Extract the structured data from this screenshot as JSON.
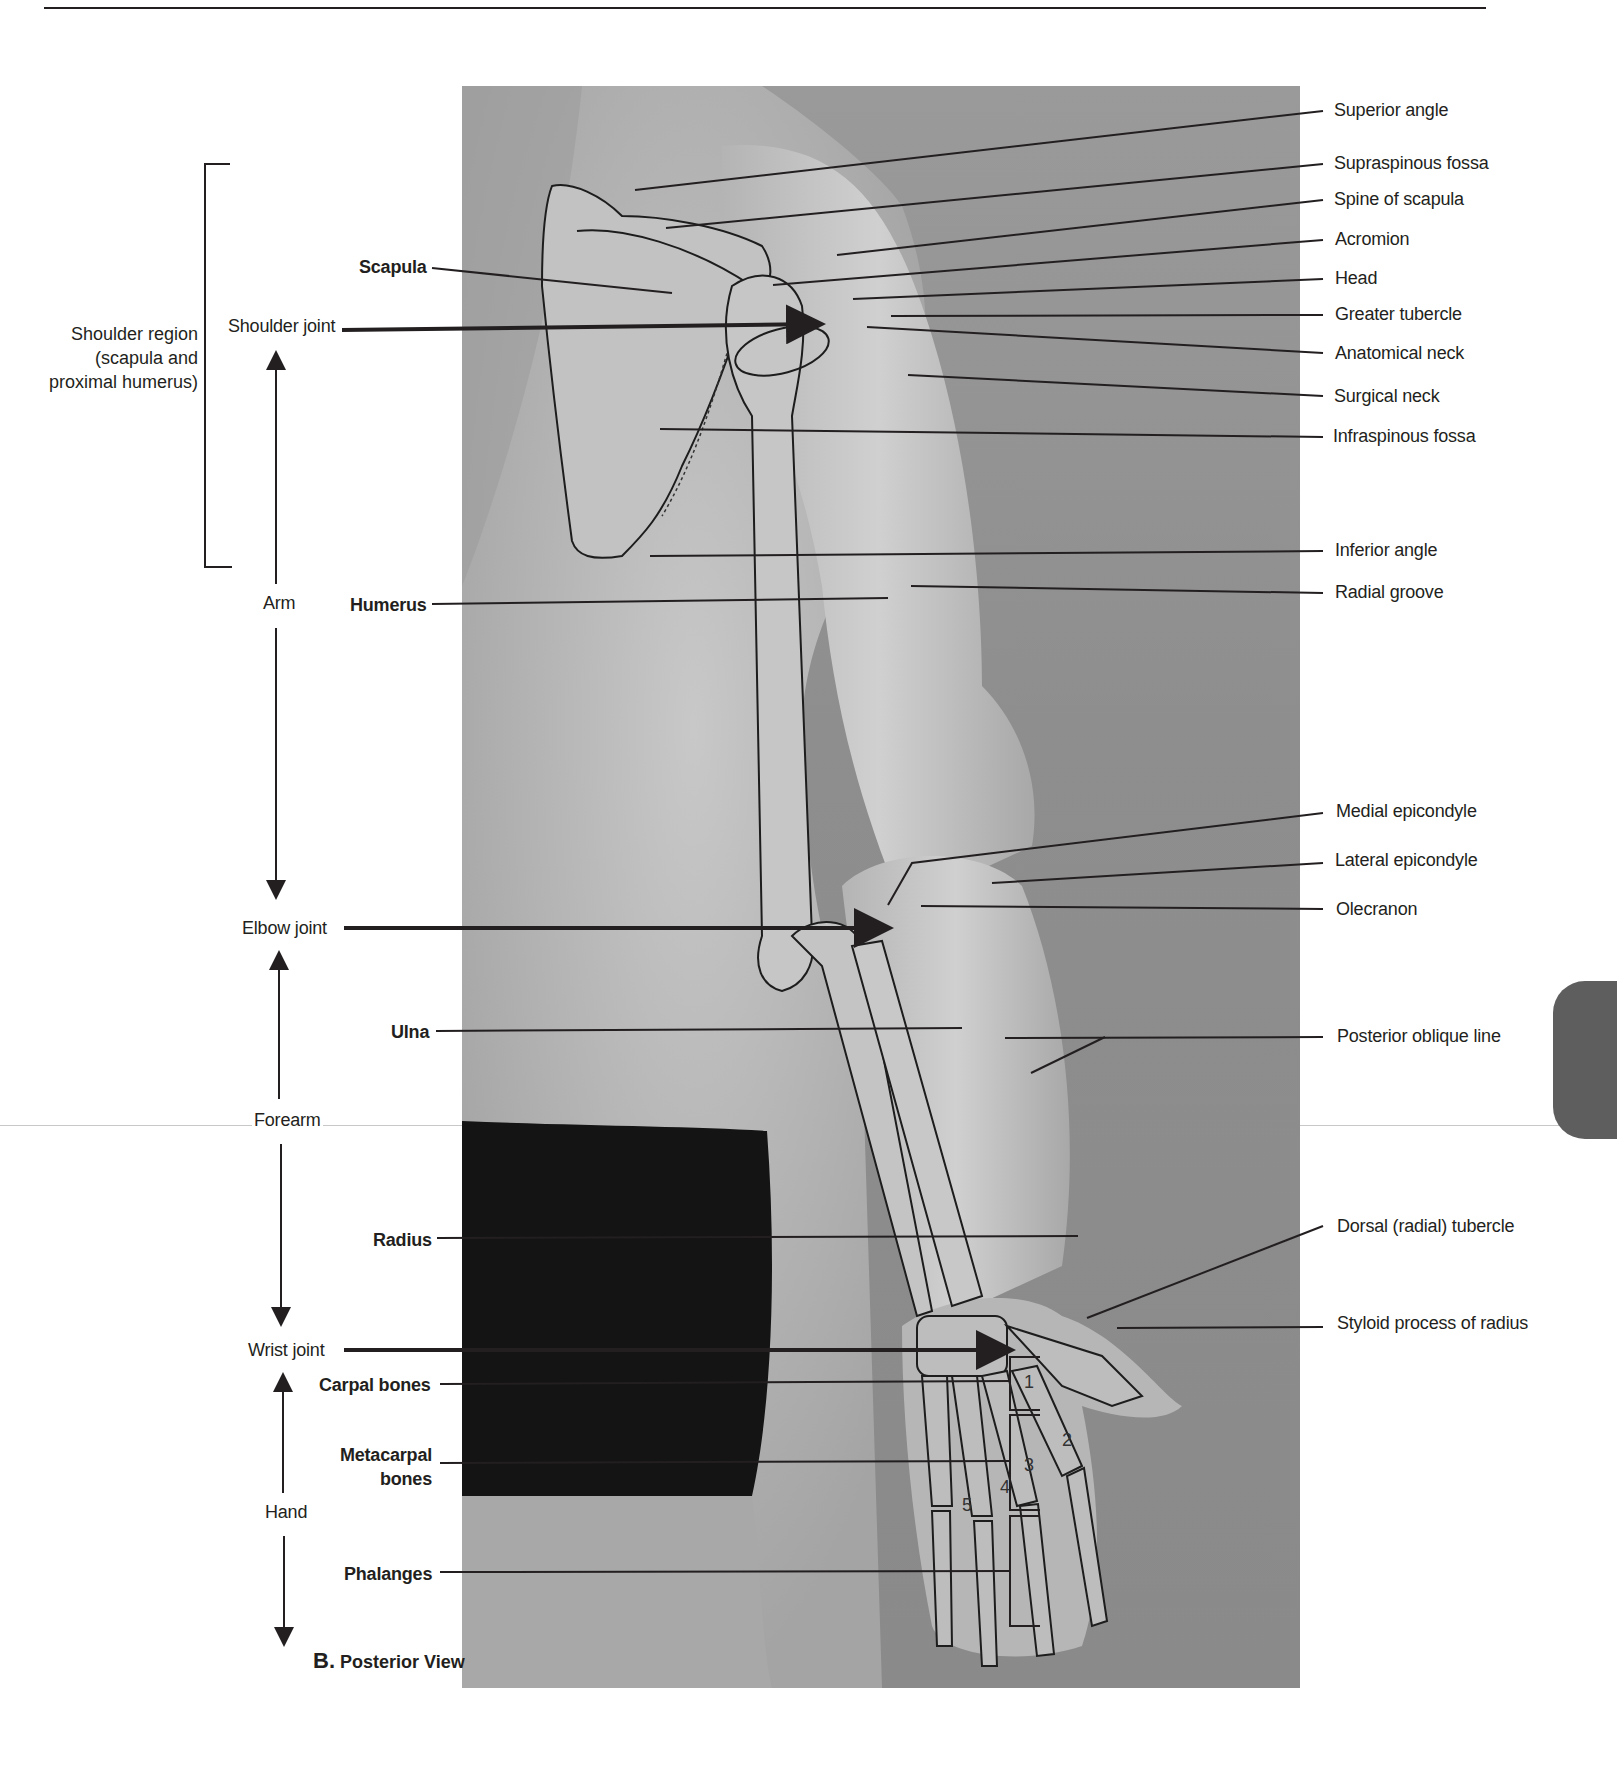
{
  "figure": {
    "panel_letter": "B.",
    "panel_title": "Posterior View",
    "regions": [
      {
        "id": "shoulder_region",
        "text": "Shoulder region\n(scapula and\nproximal humerus)"
      },
      {
        "id": "shoulder_joint",
        "text": "Shoulder joint"
      },
      {
        "id": "arm",
        "text": "Arm"
      },
      {
        "id": "elbow_joint",
        "text": "Elbow joint"
      },
      {
        "id": "forearm",
        "text": "Forearm"
      },
      {
        "id": "wrist_joint",
        "text": "Wrist joint"
      },
      {
        "id": "hand",
        "text": "Hand"
      }
    ],
    "left_labels": [
      {
        "text": "Scapula",
        "bold": true
      },
      {
        "text": "Humerus",
        "bold": true
      },
      {
        "text": "Ulna",
        "bold": true
      },
      {
        "text": "Radius",
        "bold": true
      },
      {
        "text": "Carpal bones",
        "bold": true
      },
      {
        "text": "Metacarpal\nbones",
        "bold": true
      },
      {
        "text": "Phalanges",
        "bold": true
      }
    ],
    "right_labels": [
      "Superior angle",
      "Supraspinous fossa",
      "Spine of scapula",
      "Acromion",
      "Head",
      "Greater tubercle",
      "Anatomical neck",
      "Surgical neck",
      "Infraspinous fossa",
      "Inferior angle",
      "Radial groove",
      "Medial epicondyle",
      "Lateral epicondyle",
      "Olecranon",
      "Posterior oblique line",
      "Dorsal (radial) tubercle",
      "Styloid process of radius"
    ],
    "metacarpal_numbers": [
      "1",
      "2",
      "3",
      "4",
      "5"
    ]
  },
  "colors": {
    "text": "#231f20",
    "photo_bg": "#8e8e8e",
    "thumb_tab": "#5e5e5e"
  }
}
